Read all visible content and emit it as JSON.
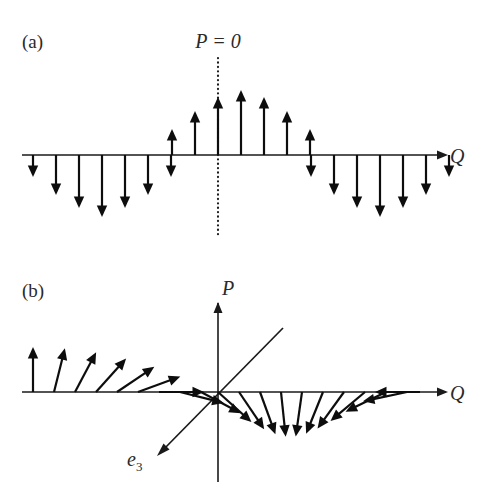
{
  "figure": {
    "background_color": "#ffffff",
    "ink_color": "#1a1a1a",
    "width": 482,
    "height": 493
  },
  "panels": [
    {
      "id": "panel-a",
      "label": "(a)",
      "label_x": 22,
      "label_y": 48,
      "axis": {
        "name": "Q",
        "label": "Q",
        "label_x": 450,
        "label_y": 163,
        "y": 155,
        "x_start": 22,
        "x_end": 437,
        "arrowhead": "right"
      },
      "vertical_guide": {
        "style": "dotted",
        "label": "P = 0",
        "label_x": 218,
        "label_y": 48,
        "x": 218,
        "y_top": 58,
        "y_bottom": 236
      },
      "description": "Sinusoidal spin-density wave: up spins near centre, down spins on both flanks.",
      "spins": [
        {
          "x": 33,
          "length": 22,
          "angle_deg": 180
        },
        {
          "x": 55,
          "length": 40,
          "angle_deg": 180
        },
        {
          "x": 78,
          "length": 53,
          "angle_deg": 180
        },
        {
          "x": 101,
          "length": 60,
          "angle_deg": 180
        },
        {
          "x": 124,
          "length": 53,
          "angle_deg": 180
        },
        {
          "x": 147,
          "length": 40,
          "angle_deg": 180
        },
        {
          "x": 170,
          "length": 22,
          "angle_deg": 180
        },
        {
          "x": 195,
          "length": 26,
          "angle_deg": 0
        },
        {
          "x": 172,
          "length": 0,
          "angle_deg": 0
        },
        {
          "x": 172,
          "length": 0,
          "angle_deg": 0
        }
      ],
      "spins_up": [
        {
          "x": 172,
          "length": 26,
          "angle_deg": 0
        },
        {
          "x": 195,
          "length": 44,
          "angle_deg": 0
        },
        {
          "x": 218,
          "length": 58,
          "angle_deg": 0
        },
        {
          "x": 241,
          "length": 65,
          "angle_deg": 0
        },
        {
          "x": 264,
          "length": 58,
          "angle_deg": 0
        },
        {
          "x": 287,
          "length": 44,
          "angle_deg": 0
        },
        {
          "x": 310,
          "length": 26,
          "angle_deg": 0
        }
      ],
      "spins_left": [
        {
          "x": 33,
          "length": 22
        },
        {
          "x": 56,
          "length": 40
        },
        {
          "x": 79,
          "length": 53
        },
        {
          "x": 102,
          "length": 62
        },
        {
          "x": 125,
          "length": 53
        },
        {
          "x": 148,
          "length": 40
        },
        {
          "x": 171,
          "length": 22
        }
      ],
      "spins_right": [
        {
          "x": 311,
          "length": 22
        },
        {
          "x": 334,
          "length": 40
        },
        {
          "x": 357,
          "length": 53
        },
        {
          "x": 380,
          "length": 62
        },
        {
          "x": 403,
          "length": 53
        },
        {
          "x": 426,
          "length": 40
        },
        {
          "x": 449,
          "length": 22
        }
      ]
    },
    {
      "id": "panel-b",
      "label": "(b)",
      "label_x": 22,
      "label_y": 297,
      "axis_horizontal": {
        "name": "Q",
        "label": "Q",
        "label_x": 450,
        "label_y": 400,
        "y": 392,
        "x_start": 22,
        "x_end": 437,
        "arrowhead": "right"
      },
      "axis_vertical": {
        "name": "P",
        "label": "P",
        "label_x": 222,
        "label_y": 295,
        "x": 218,
        "y_top": 303,
        "y_bottom": 482,
        "arrowhead": "up"
      },
      "diagonal_axis": {
        "name": "e3",
        "label": "e",
        "subscript": "3",
        "label_x": 127,
        "label_y": 466,
        "x_start": 283,
        "y_start": 328,
        "x_end": 158,
        "y_end": 455,
        "arrowhead": "end"
      },
      "description": "Helical / rotating spin configuration: spin direction rotates continuously along Q.",
      "spin_length": 45,
      "spins": [
        {
          "x": 33,
          "angle_deg": 0
        },
        {
          "x": 54,
          "angle_deg": 14
        },
        {
          "x": 75,
          "angle_deg": 28
        },
        {
          "x": 96,
          "angle_deg": 42
        },
        {
          "x": 117,
          "angle_deg": 56
        },
        {
          "x": 138,
          "angle_deg": 70
        },
        {
          "x": 159,
          "angle_deg": 90
        },
        {
          "x": 180,
          "angle_deg": 104
        },
        {
          "x": 201,
          "angle_deg": 118
        },
        {
          "x": 218,
          "angle_deg": 132
        },
        {
          "x": 239,
          "angle_deg": 146
        },
        {
          "x": 260,
          "angle_deg": 160
        },
        {
          "x": 281,
          "angle_deg": 174
        },
        {
          "x": 302,
          "angle_deg": 188
        },
        {
          "x": 323,
          "angle_deg": 202
        },
        {
          "x": 344,
          "angle_deg": 216
        },
        {
          "x": 365,
          "angle_deg": 230
        },
        {
          "x": 386,
          "angle_deg": 244
        },
        {
          "x": 407,
          "angle_deg": 258
        },
        {
          "x": 420,
          "angle_deg": 270
        }
      ]
    }
  ],
  "chart_data": {
    "type": "line",
    "title": "",
    "xlabel": "Q",
    "ylabel": "P",
    "grid": false,
    "legend": "none",
    "panels": [
      {
        "label": "(a)",
        "kind": "collinear-spin-density-wave",
        "axis_x": "Q",
        "annotation": "P = 0",
        "x": [
          33,
          56,
          79,
          102,
          125,
          148,
          171,
          194,
          218,
          241,
          264,
          287,
          310,
          334,
          357,
          380,
          403,
          426,
          449
        ],
        "values": [
          -22,
          -40,
          -53,
          -62,
          -53,
          -40,
          -22,
          44,
          58,
          65,
          58,
          44,
          22,
          -40,
          -53,
          -62,
          -53,
          -40,
          -22
        ],
        "note": "Arrow lengths in px; negative = pointing down, positive = pointing up."
      },
      {
        "label": "(b)",
        "kind": "rotating-spin-configuration",
        "axis_x": "Q",
        "axis_y": "P",
        "diagonal_axis": "e3",
        "x": [
          33,
          54,
          75,
          96,
          117,
          138,
          159,
          180,
          201,
          218,
          239,
          260,
          281,
          302,
          323,
          344,
          365,
          386,
          407,
          420
        ],
        "angles_deg": [
          0,
          14,
          28,
          42,
          56,
          70,
          90,
          104,
          118,
          132,
          146,
          160,
          174,
          188,
          202,
          216,
          230,
          244,
          258,
          270
        ],
        "arrow_length": 45,
        "note": "Angle measured clockwise from straight-up (0 deg = up, 90 deg = right, 180 deg = down, 270 deg = left)."
      }
    ]
  }
}
